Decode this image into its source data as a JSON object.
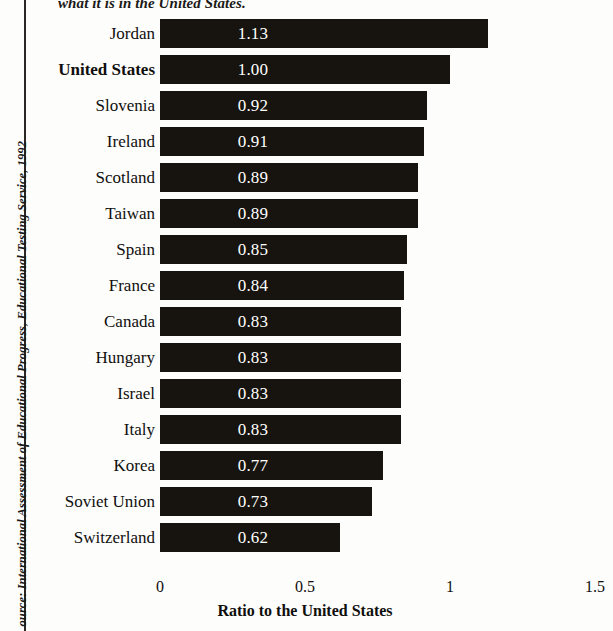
{
  "figure": {
    "title_fragment": "what it is in the United States.",
    "source_note": "ource: International Assessment of Educational Progress, Educational Testing Service, 1992",
    "bar_color": "#17140f",
    "value_text_color": "#ffffff",
    "highlight_country": "United States"
  },
  "axis": {
    "title": "Ratio to the United States",
    "ticks": [
      "0",
      "0.5",
      "1",
      "1.5"
    ]
  },
  "chart_data": {
    "type": "bar",
    "orientation": "horizontal",
    "title": "what it is in the United States.",
    "xlabel": "Ratio to the United States",
    "ylabel": "",
    "xlim": [
      0,
      1.5
    ],
    "grid": false,
    "legend": null,
    "tick_labels": [
      "0",
      "0.5",
      "1",
      "1.5"
    ],
    "tick_values": [
      0,
      0.5,
      1,
      1.5
    ],
    "categories": [
      "Jordan",
      "United States",
      "Slovenia",
      "Ireland",
      "Scotland",
      "Taiwan",
      "Spain",
      "France",
      "Canada",
      "Hungary",
      "Israel",
      "Italy",
      "Korea",
      "Soviet Union",
      "Switzerland"
    ],
    "values": [
      1.13,
      1.0,
      0.92,
      0.91,
      0.89,
      0.89,
      0.85,
      0.84,
      0.83,
      0.83,
      0.83,
      0.83,
      0.77,
      0.73,
      0.62
    ],
    "data_labels": [
      "1.13",
      "1.00",
      "0.92",
      "0.91",
      "0.89",
      "0.89",
      "0.85",
      "0.84",
      "0.83",
      "0.83",
      "0.83",
      "0.83",
      "0.77",
      "0.73",
      "0.62"
    ],
    "bars": [
      {
        "label": "Jordan",
        "value": 1.13,
        "display": "1.13",
        "bold": false
      },
      {
        "label": "United States",
        "value": 1.0,
        "display": "1.00",
        "bold": true
      },
      {
        "label": "Slovenia",
        "value": 0.92,
        "display": "0.92",
        "bold": false
      },
      {
        "label": "Ireland",
        "value": 0.91,
        "display": "0.91",
        "bold": false
      },
      {
        "label": "Scotland",
        "value": 0.89,
        "display": "0.89",
        "bold": false
      },
      {
        "label": "Taiwan",
        "value": 0.89,
        "display": "0.89",
        "bold": false
      },
      {
        "label": "Spain",
        "value": 0.85,
        "display": "0.85",
        "bold": false
      },
      {
        "label": "France",
        "value": 0.84,
        "display": "0.84",
        "bold": false
      },
      {
        "label": "Canada",
        "value": 0.83,
        "display": "0.83",
        "bold": false
      },
      {
        "label": "Hungary",
        "value": 0.83,
        "display": "0.83",
        "bold": false
      },
      {
        "label": "Israel",
        "value": 0.83,
        "display": "0.83",
        "bold": false
      },
      {
        "label": "Italy",
        "value": 0.83,
        "display": "0.83",
        "bold": false
      },
      {
        "label": "Korea",
        "value": 0.77,
        "display": "0.77",
        "bold": false
      },
      {
        "label": "Soviet Union",
        "value": 0.73,
        "display": "0.73",
        "bold": false
      },
      {
        "label": "Switzerland",
        "value": 0.62,
        "display": "0.62",
        "bold": false
      }
    ]
  }
}
